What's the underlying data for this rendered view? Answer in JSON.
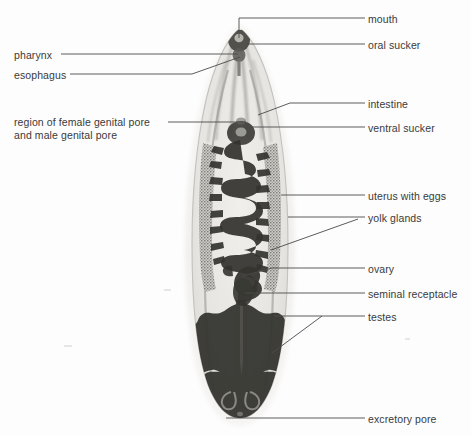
{
  "figure": {
    "background_color": "#fdfdfd",
    "text_color": "#3a3a3a",
    "leader_color": "#4a4a4a",
    "body_fill": "#e8e7e4",
    "body_edge": "#b9b8b4",
    "organ_dark": "#3b3a38",
    "organ_mid": "#6f6e6b",
    "yolk_gland_tone": "#7d7c78"
  },
  "labels": {
    "right": [
      {
        "id": "mouth",
        "text": "mouth",
        "x": 368,
        "y": 13
      },
      {
        "id": "oral-sucker",
        "text": "oral sucker",
        "x": 368,
        "y": 39
      },
      {
        "id": "intestine",
        "text": "intestine",
        "x": 368,
        "y": 98
      },
      {
        "id": "ventral-sucker",
        "text": "ventral sucker",
        "x": 368,
        "y": 122
      },
      {
        "id": "uterus-with-eggs",
        "text": "uterus with eggs",
        "x": 368,
        "y": 190
      },
      {
        "id": "yolk-glands",
        "text": "yolk glands",
        "x": 368,
        "y": 212
      },
      {
        "id": "ovary",
        "text": "ovary",
        "x": 368,
        "y": 263
      },
      {
        "id": "seminal-receptacle",
        "text": "seminal receptacle",
        "x": 368,
        "y": 288
      },
      {
        "id": "testes",
        "text": "testes",
        "x": 368,
        "y": 311
      },
      {
        "id": "excretory-pore",
        "text": "excretory pore",
        "x": 368,
        "y": 413
      }
    ],
    "left": [
      {
        "id": "pharynx",
        "text": "pharynx",
        "x": 14,
        "y": 49
      },
      {
        "id": "esophagus",
        "text": "esophagus",
        "x": 14,
        "y": 69
      },
      {
        "id": "genital-pore-region",
        "text": "region of female genital pore\nand male genital pore",
        "x": 14,
        "y": 116
      }
    ]
  },
  "leader_lines": [
    {
      "id": "mouth-leader",
      "points": "365,18 239,18 239,38"
    },
    {
      "id": "oral-sucker-leader",
      "points": "365,44 246,44"
    },
    {
      "id": "intestine-leader",
      "points": "365,103 290,103 258,115"
    },
    {
      "id": "ventral-sucker-leader",
      "points": "365,127 248,127"
    },
    {
      "id": "uterus-leader",
      "points": "365,195 281,195"
    },
    {
      "id": "yolk-glands-leader-a",
      "points": "365,217 288,217"
    },
    {
      "id": "yolk-glands-leader-b",
      "points": "358,219 271,250"
    },
    {
      "id": "ovary-leader",
      "points": "365,268 272,268 243,276"
    },
    {
      "id": "seminal-receptacle-leader",
      "points": "365,293 245,293"
    },
    {
      "id": "testes-leader-a",
      "points": "365,316 274,316"
    },
    {
      "id": "testes-leader-b",
      "points": "322,316 272,353"
    },
    {
      "id": "excretory-pore-leader",
      "points": "365,418 226,418"
    },
    {
      "id": "pharynx-leader",
      "points": "61,54 238,54"
    },
    {
      "id": "esophagus-leader",
      "points": "70,74 192,74 240,57"
    },
    {
      "id": "genital-pore-leader",
      "points": "168,122 246,122"
    }
  ]
}
